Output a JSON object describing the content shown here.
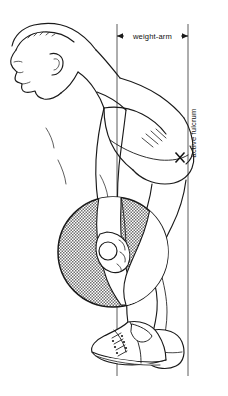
{
  "illustration": {
    "title": "Bent-over barbell row biomechanics diagram",
    "subject": "male athlete in side profile, torso flexed forward, holding a loaded barbell",
    "style": "black ink line drawing on white background with stippled weight plate",
    "background_color": "#ffffff",
    "ink_color": "#1a1a1a",
    "plate_fill_color": "#b9b9b9"
  },
  "annotations": {
    "weight_arm": {
      "label": "weight-arm",
      "orientation": "horizontal",
      "arrow": "double-headed",
      "from_line": "barbell-vertical",
      "to_line": "fulcrum-vertical"
    },
    "active_fulcrum": {
      "label": "active fulcrum",
      "orientation": "vertical-rotated",
      "marker": "x-mark",
      "marker_location": "hip joint"
    }
  },
  "reference_lines": [
    {
      "name": "barbell-vertical",
      "x": 117,
      "y_top": 24,
      "y_bottom": 376
    },
    {
      "name": "fulcrum-vertical",
      "x": 188,
      "y_top": 24,
      "y_bottom": 376
    }
  ],
  "figure_parts": [
    {
      "name": "head",
      "detail": "side profile facing left, short hair, ear, nose, chin"
    },
    {
      "name": "neck"
    },
    {
      "name": "shoulder"
    },
    {
      "name": "tank-top",
      "detail": "sleeveless singlet over torso"
    },
    {
      "name": "back",
      "detail": "muscular flexed back"
    },
    {
      "name": "arm",
      "detail": "extended hanging arm"
    },
    {
      "name": "hand",
      "detail": "gripping the barbell"
    },
    {
      "name": "hip",
      "detail": "gluteal mass, pivot point"
    },
    {
      "name": "thigh"
    },
    {
      "name": "knee"
    },
    {
      "name": "calf"
    },
    {
      "name": "shoe",
      "detail": "high-top athletic sneaker with laces"
    }
  ],
  "equipment": {
    "barbell": {
      "name": "barbell",
      "plate": {
        "name": "weight-plate",
        "shape": "circle",
        "center_x": 113,
        "center_y": 252,
        "radius": 55,
        "fill": "stippled-gray"
      },
      "bar": {
        "name": "barbell-bar",
        "shape": "small circle at grip",
        "center_x": 108,
        "center_y": 251,
        "radius": 9
      }
    }
  }
}
